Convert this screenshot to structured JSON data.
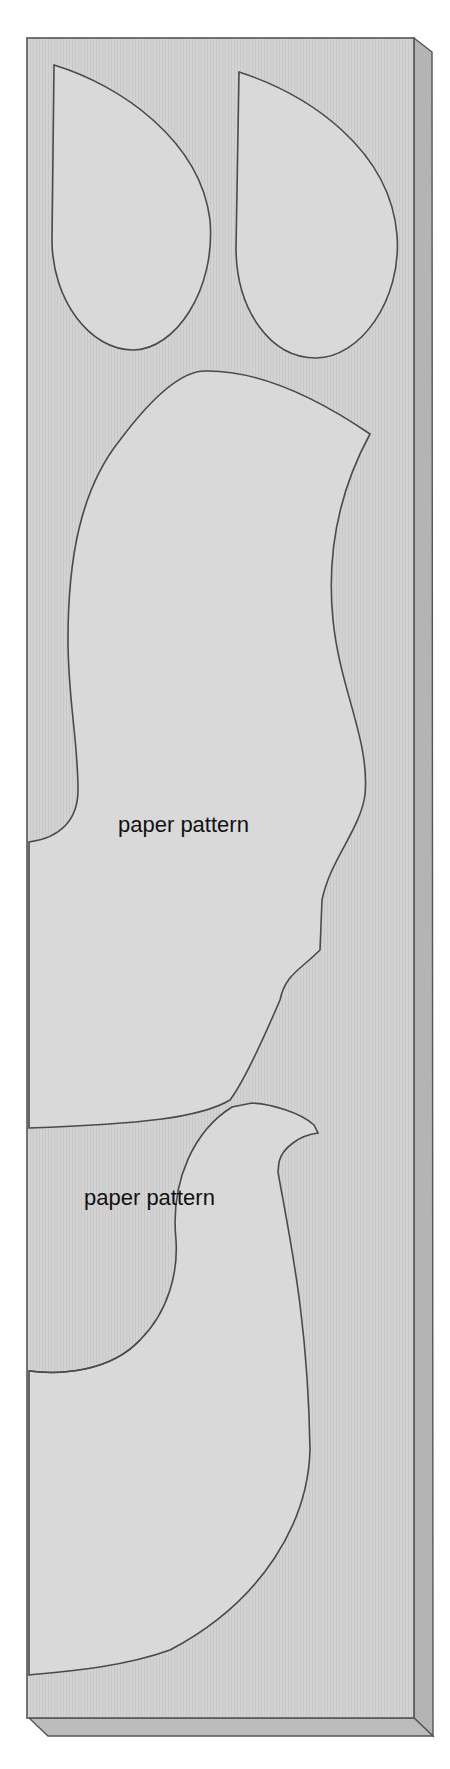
{
  "figure": {
    "labels": [
      {
        "text": "paper pattern",
        "x": 118,
        "y": 830
      },
      {
        "text": "paper pattern",
        "x": 84,
        "y": 1203
      }
    ],
    "colors": {
      "board": "#d2d2d2",
      "board_side": "#b4b4b4",
      "pattern_fill": "#d9d9d9",
      "outline": "#4a4a4a",
      "text": "#111111"
    },
    "shapes": [
      {
        "name": "left-teardrop"
      },
      {
        "name": "right-teardrop"
      },
      {
        "name": "body-piece"
      },
      {
        "name": "bird-neck-piece"
      }
    ]
  }
}
